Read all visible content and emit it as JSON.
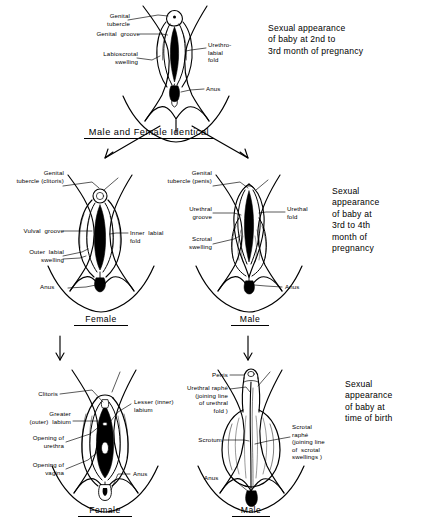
{
  "figure": {
    "ink_color": "#000000",
    "background_color": "#ffffff"
  },
  "stages": [
    {
      "id": "indifferent",
      "name": "Male and Female Identical",
      "caption": "Sexual appearance\nof baby at 2nd to\n3rd month of pregnancy",
      "labels": [
        "Genital\ntubercle",
        "Genital  groove",
        "Labioscrotal\nswelling",
        "Urethro-\nlabial\nfold",
        "Anus"
      ]
    },
    {
      "id": "differentiating-female",
      "name": "Female",
      "labels": [
        "Genital\ntubercle (clitoris)",
        "Vulval  groove",
        "Outer  labial\nswelling",
        "Inner  labial\nfold",
        "Anus"
      ]
    },
    {
      "id": "differentiating-male",
      "name": "Male",
      "caption": "Sexual\nappearance\nof baby at\n3rd to 4th\nmonth of\npregnancy",
      "labels": [
        "Genital\ntubercle (penis)",
        "Urethral\ngroove",
        "Scrotal\nswelling",
        "Urethal\nfold",
        "Anus"
      ]
    },
    {
      "id": "birth-female",
      "name": "Female",
      "labels": [
        "Clitoris",
        "Greater\n(outer)  labium",
        "Opening of\nurethra",
        "Opening of\nvagina",
        "Lesser (inner)\nlabium",
        "Anus"
      ]
    },
    {
      "id": "birth-male",
      "name": "Male",
      "caption": "Sexual\nappearance\nof baby at\ntime of birth",
      "labels": [
        "Penis",
        "Urethral raphé\n(joining line\nof urethral\nfold )",
        "Scrotum",
        "Scrotal\nraphé\n(joining line\nof  scrotal\nswellings )",
        "Anus"
      ]
    }
  ],
  "row1": {
    "caption": "Sexual appearance\nof baby at 2nd to\n3rd month of pregnancy",
    "stage_name": "Male and Female Identical",
    "label_genital_tubercle": "Genital\ntubercle",
    "label_genital_groove": "Genital  groove",
    "label_labioscrotal_swelling": "Labioscrotal\nswelling",
    "label_urethrolabial_fold": "Urethro-\nlabial\nfold",
    "label_anus": "Anus"
  },
  "row2": {
    "caption": "Sexual\nappearance\nof baby at\n3rd to 4th\nmonth of\npregnancy",
    "female": {
      "stage_name": "Female",
      "label_genital_tubercle": "Genital\ntubercle (clitoris)",
      "label_vulval_groove": "Vulval  groove",
      "label_outer_labial_swelling": "Outer  labial\nswelling",
      "label_inner_labial_fold": "Inner  labial\nfold",
      "label_anus": "Anus"
    },
    "male": {
      "stage_name": "Male",
      "label_genital_tubercle": "Genital\ntubercle (penis)",
      "label_urethral_groove": "Urethral\ngroove",
      "label_scrotal_swelling": "Scrotal\nswelling",
      "label_urethal_fold": "Urethal\nfold",
      "label_anus": "Anus"
    }
  },
  "row3": {
    "caption": "Sexual\nappearance\nof baby at\ntime of birth",
    "female": {
      "stage_name": "Female",
      "label_clitoris": "Clitoris",
      "label_greater_labium": "Greater\n(outer)  labium",
      "label_opening_urethra": "Opening of\nurethra",
      "label_opening_vagina": "Opening of\nvagina",
      "label_lesser_labium": "Lesser (inner)\nlabium",
      "label_anus": "Anus"
    },
    "male": {
      "stage_name": "Male",
      "label_penis": "Penis",
      "label_urethral_raphe": "Urethral raphé\n(joining line\nof urethral\nfold )",
      "label_scrotum": "Scrotum",
      "label_scrotal_raphe": "Scrotal\nraphé\n(joining line\nof  scrotal\nswellings )",
      "label_anus": "Anus"
    }
  }
}
